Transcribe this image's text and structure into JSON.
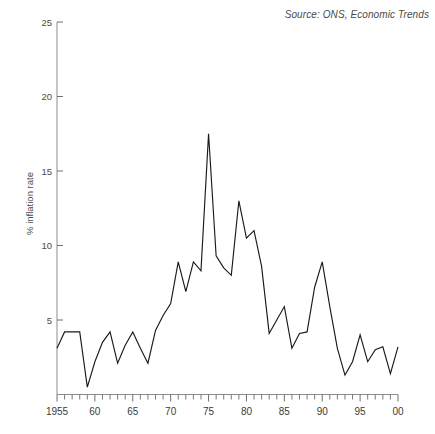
{
  "chart_data": {
    "type": "line",
    "title": "",
    "subtitle": "",
    "source_note": "Source: ONS, Economic Trends",
    "xlabel": "",
    "ylabel": "% inflation rate",
    "xlim": [
      1955,
      2000
    ],
    "ylim": [
      0,
      25
    ],
    "grid": false,
    "legend": "none",
    "y_ticks": [
      5,
      10,
      15,
      20,
      25
    ],
    "y_tick_labels": [
      "5",
      "10",
      "15",
      "20",
      "25"
    ],
    "x_ticks": [
      1955,
      1960,
      1965,
      1970,
      1975,
      1980,
      1985,
      1990,
      1995,
      2000
    ],
    "x_tick_labels": [
      "1955",
      "60",
      "65",
      "70",
      "75",
      "80",
      "85",
      "90",
      "95",
      "00"
    ],
    "x_minor_tick_interval": 1,
    "line_color": "#1a1a1a",
    "axis_color": "#8c8c8c",
    "series": [
      {
        "name": "% inflation rate",
        "x": [
          1955,
          1956,
          1957,
          1958,
          1959,
          1960,
          1961,
          1962,
          1963,
          1964,
          1965,
          1966,
          1967,
          1968,
          1969,
          1970,
          1971,
          1972,
          1973,
          1974,
          1975,
          1976,
          1977,
          1978,
          1979,
          1980,
          1981,
          1982,
          1983,
          1984,
          1985,
          1986,
          1987,
          1988,
          1989,
          1990,
          1991,
          1992,
          1993,
          1994,
          1995,
          1996,
          1997,
          1998,
          1999,
          2000
        ],
        "values": [
          3.1,
          4.2,
          4.2,
          4.2,
          0.5,
          2.2,
          3.5,
          4.2,
          2.1,
          3.3,
          4.2,
          3.1,
          2.1,
          4.3,
          5.3,
          6.1,
          8.9,
          6.9,
          8.9,
          8.3,
          17.5,
          9.3,
          8.5,
          8.0,
          13.0,
          10.5,
          11.0,
          8.6,
          4.1,
          5.0,
          5.9,
          3.1,
          4.1,
          4.2,
          7.2,
          8.9,
          5.9,
          3.1,
          1.3,
          2.2,
          4.0,
          2.2,
          3.0,
          3.2,
          1.4,
          3.2
        ]
      }
    ]
  },
  "axis": {
    "y_title": "% inflation rate"
  },
  "annotations": {
    "source": "Source: ONS, Economic Trends"
  }
}
